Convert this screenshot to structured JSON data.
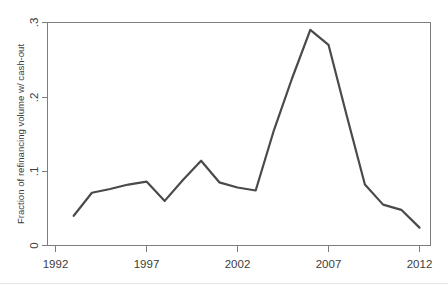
{
  "chart_data": {
    "type": "line",
    "title": "",
    "subtitle": "",
    "xlabel": "",
    "ylabel": "Fraction of refinancing volume w/ cash-out",
    "xlim": [
      1992,
      2012
    ],
    "ylim": [
      0,
      0.3
    ],
    "grid": false,
    "legend": null,
    "xticks": [
      "1992",
      "1997",
      "2002",
      "2007",
      "2012"
    ],
    "xtick_values": [
      1992,
      1997,
      2002,
      2007,
      2012
    ],
    "yticks": [
      "0",
      ".1",
      ".2",
      ".3"
    ],
    "ytick_values": [
      0,
      0.1,
      0.2,
      0.3
    ],
    "line_color": "#4a4a4a",
    "axis_color": "#7d7d7d",
    "background_color": "#ffffff",
    "series": [
      {
        "name": "Fraction of refinancing volume w/ cash-out",
        "x": [
          1993,
          1994,
          1995,
          1996,
          1997,
          1998,
          1999,
          2000,
          2001,
          2002,
          2003,
          2004,
          2005,
          2006,
          2007,
          2008,
          2009,
          2010,
          2011,
          2012
        ],
        "values": [
          0.04,
          0.071,
          0.076,
          0.082,
          0.086,
          0.06,
          0.088,
          0.114,
          0.085,
          0.078,
          0.074,
          0.155,
          0.225,
          0.29,
          0.27,
          0.175,
          0.082,
          0.055,
          0.048,
          0.024
        ]
      }
    ]
  },
  "figure": {
    "y_axis_title": "Fraction of refinancing volume w/ cash-out",
    "x_tick_labels": [
      "1992",
      "1997",
      "2002",
      "2007",
      "2012"
    ],
    "y_tick_labels": [
      "0",
      ".1",
      ".2",
      ".3"
    ]
  }
}
